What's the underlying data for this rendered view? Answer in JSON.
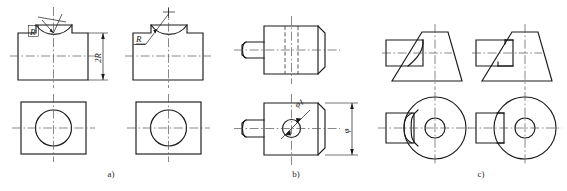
{
  "sheet": {
    "title": "Engineering drawing comparison plate",
    "background_color": "#ffffff",
    "line_color": "#1a1a1a",
    "centerline_color": "#555555"
  },
  "figures": [
    {
      "key": "a",
      "caption": "a)",
      "description": "Block with concave cylindrical groove cut in top face; front view and top view",
      "variants": [
        {
          "role": "left-variant",
          "labels": [
            {
              "name": "radius-label",
              "text": "R"
            },
            {
              "name": "height-dimension-label",
              "text": "2R"
            }
          ]
        },
        {
          "role": "right-variant",
          "labels": [
            {
              "name": "radius-label",
              "text": "R"
            }
          ]
        }
      ]
    },
    {
      "key": "b",
      "caption": "b)",
      "description": "Cylindrical body with conical left stub, front view and top view",
      "variants": [
        {
          "role": "front-view",
          "labels": []
        },
        {
          "role": "top-view",
          "labels": [
            {
              "name": "bore-diameter-label",
              "text": "φ1"
            },
            {
              "name": "width-dimension-label",
              "text": "φ"
            }
          ]
        }
      ]
    },
    {
      "key": "c",
      "caption": "c)",
      "description": "Truncated cone with rectangular key boss; correct and incorrect intersection curves",
      "variants": [
        {
          "role": "left-correct",
          "labels": []
        },
        {
          "role": "right-incorrect",
          "labels": []
        }
      ]
    }
  ],
  "captions": {
    "a": "a)",
    "b": "b)",
    "c": "c)"
  },
  "text_labels": {
    "radius_a1": "R",
    "dimension_2r": "2R",
    "radius_a2": "R",
    "bore_diameter": "φ1",
    "overall_width": "φ"
  }
}
